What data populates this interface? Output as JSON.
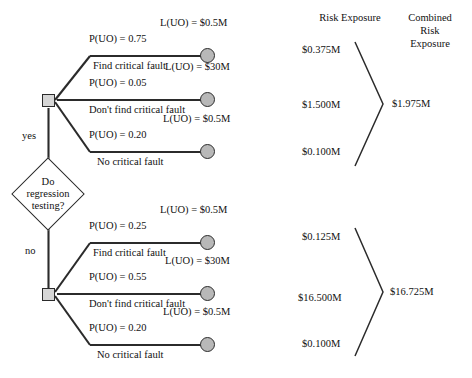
{
  "diagram": {
    "decision_node": {
      "label_lines": [
        "Do",
        "regression",
        "testing?"
      ],
      "branches": {
        "yes": "yes",
        "no": "no"
      }
    },
    "columns": {
      "risk_exposure_header": "Risk Exposure",
      "combined_header_lines": [
        "Combined",
        "Risk",
        "Exposure"
      ]
    },
    "upper": {
      "branch_label": "yes",
      "outcomes": [
        {
          "probability": "P(UO)  = 0.75",
          "description": "Find critical fault",
          "loss": "L(UO) = $0.5M",
          "risk_exposure": "$0.375M"
        },
        {
          "probability": "P(UO)  = 0.05",
          "description": "Don't find critical fault",
          "loss": "L(UO) = $30M",
          "risk_exposure": "$1.500M"
        },
        {
          "probability": "P(UO)  = 0.20",
          "description": "No critical fault",
          "loss": "L(UO) = $0.5M",
          "risk_exposure": "$0.100M"
        }
      ],
      "combined_risk_exposure": "$1.975M"
    },
    "lower": {
      "branch_label": "no",
      "outcomes": [
        {
          "probability": "P(UO)  = 0.25",
          "description": "Find critical fault",
          "loss": "L(UO) = $0.5M",
          "risk_exposure": "$0.125M"
        },
        {
          "probability": "P(UO)  = 0.55",
          "description": "Don't find critical fault",
          "loss": "L(UO) = $30M",
          "risk_exposure": "$16.500M"
        },
        {
          "probability": "P(UO)  = 0.20",
          "description": "No critical fault",
          "loss": "L(UO) = $0.5M",
          "risk_exposure": "$0.100M"
        }
      ],
      "combined_risk_exposure": "$16.725M"
    }
  }
}
